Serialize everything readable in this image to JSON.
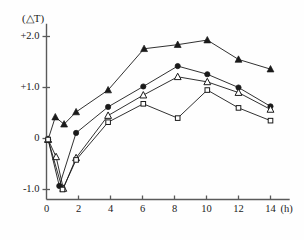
{
  "chart_data": {
    "type": "line",
    "title": "",
    "subtitle": "",
    "xlabel": "(h)",
    "ylabel": "(△T)",
    "xlim": [
      0,
      15.2
    ],
    "ylim": [
      -1.12,
      2.25
    ],
    "grid": false,
    "legend": "none",
    "x_ticks": [
      0,
      2,
      4,
      6,
      8,
      10,
      12,
      14
    ],
    "x_tick_labels": [
      "0",
      "2",
      "4",
      "6",
      "8",
      "10",
      "12",
      "14"
    ],
    "y_ticks": [
      -1.0,
      0,
      1.0,
      2.0
    ],
    "y_tick_labels": [
      "-1.0",
      "0",
      "+1.0",
      "+2.0"
    ],
    "series": [
      {
        "name": "filled-triangle-series",
        "marker": "filled-triangle",
        "color": "#1a1a1a",
        "points": [
          {
            "x": 0.1,
            "y": -0.02
          },
          {
            "x": 0.55,
            "y": 0.42
          },
          {
            "x": 1.1,
            "y": 0.28
          },
          {
            "x": 1.85,
            "y": 0.52
          },
          {
            "x": 3.85,
            "y": 0.95
          },
          {
            "x": 6.1,
            "y": 1.76
          },
          {
            "x": 8.2,
            "y": 1.84
          },
          {
            "x": 10.05,
            "y": 1.93
          },
          {
            "x": 12.0,
            "y": 1.55
          },
          {
            "x": 14.0,
            "y": 1.36
          }
        ]
      },
      {
        "name": "filled-circle-series",
        "marker": "filled-circle",
        "color": "#1a1a1a",
        "points": [
          {
            "x": 0.1,
            "y": -0.02
          },
          {
            "x": 0.8,
            "y": -0.93
          },
          {
            "x": 1.85,
            "y": 0.11
          },
          {
            "x": 3.85,
            "y": 0.62
          },
          {
            "x": 6.05,
            "y": 1.02
          },
          {
            "x": 8.2,
            "y": 1.42
          },
          {
            "x": 10.05,
            "y": 1.26
          },
          {
            "x": 12.0,
            "y": 1.0
          },
          {
            "x": 14.0,
            "y": 0.63
          }
        ]
      },
      {
        "name": "open-triangle-series",
        "marker": "open-triangle",
        "color": "#1a1a1a",
        "points": [
          {
            "x": 0.1,
            "y": -0.02
          },
          {
            "x": 0.6,
            "y": -0.36
          },
          {
            "x": 1.05,
            "y": -0.98
          },
          {
            "x": 1.85,
            "y": -0.38
          },
          {
            "x": 3.85,
            "y": 0.45
          },
          {
            "x": 6.05,
            "y": 0.85
          },
          {
            "x": 8.2,
            "y": 1.21
          },
          {
            "x": 10.05,
            "y": 1.11
          },
          {
            "x": 12.0,
            "y": 0.9
          },
          {
            "x": 14.0,
            "y": 0.57
          }
        ]
      },
      {
        "name": "open-square-series",
        "marker": "open-square",
        "color": "#1a1a1a",
        "points": [
          {
            "x": 0.1,
            "y": -0.02
          },
          {
            "x": 1.0,
            "y": -1.0
          },
          {
            "x": 1.85,
            "y": -0.42
          },
          {
            "x": 3.85,
            "y": 0.32
          },
          {
            "x": 6.05,
            "y": 0.68
          },
          {
            "x": 8.2,
            "y": 0.4
          },
          {
            "x": 10.05,
            "y": 0.95
          },
          {
            "x": 12.0,
            "y": 0.6
          },
          {
            "x": 14.0,
            "y": 0.35
          }
        ]
      }
    ]
  }
}
